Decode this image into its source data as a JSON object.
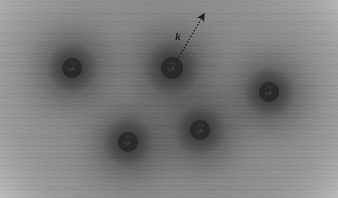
{
  "figure": {
    "width": 338,
    "height": 198,
    "background_color": "#ffffff",
    "cloud_color": "#9a9a9a",
    "cloud_mid_color": "#a8a8a8",
    "halo_color": "#4a4a4a",
    "site_color": "#2a2a2a",
    "arrow_color": "#1c1c1c"
  },
  "chart_data": {
    "type": "scatter",
    "title": "",
    "xlabel": "",
    "ylabel": "",
    "xlim": [
      0,
      338
    ],
    "ylim": [
      0,
      198
    ],
    "grid": false,
    "legend": "none",
    "colormap": "grayscale",
    "series": [
      {
        "name": "atomic-sites",
        "marker": "filled-circle",
        "marker_color": "#2a2a2a",
        "marker_radius": 10,
        "points": [
          {
            "id": "site-top-left",
            "x": 72,
            "y": 68,
            "r": 10,
            "halo_r": 52
          },
          {
            "id": "site-top-middle",
            "x": 172,
            "y": 68,
            "r": 11,
            "halo_r": 54
          },
          {
            "id": "site-right",
            "x": 269,
            "y": 92,
            "r": 10,
            "halo_r": 50
          },
          {
            "id": "site-bottom-left",
            "x": 128,
            "y": 142,
            "r": 10,
            "halo_r": 50
          },
          {
            "id": "site-bottom-middle",
            "x": 200,
            "y": 130,
            "r": 10,
            "halo_r": 50
          }
        ]
      }
    ],
    "annotations": [
      {
        "id": "wave-vector-arrow",
        "type": "arrow",
        "label": "k",
        "label_x": 178,
        "label_y": 40,
        "from_x": 176,
        "from_y": 62,
        "to_x": 204,
        "to_y": 14,
        "style": "dotted",
        "head": "filled-triangle",
        "color": "#1c1c1c"
      }
    ]
  },
  "annotation_labels": {
    "wave_vector": "k"
  }
}
